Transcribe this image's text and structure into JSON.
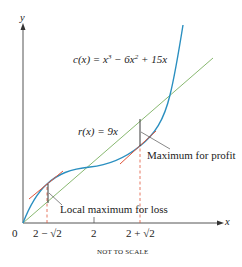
{
  "figure": {
    "axes": {
      "x_label": "x",
      "y_label": "y",
      "origin_label": "0",
      "x_ticks": [
        "2 − √2",
        "2",
        "2 + √2"
      ]
    },
    "curves": {
      "cost": {
        "name": "c(x)",
        "lhs": "c(x) = x",
        "exp1": "3",
        "mid": " − 6x",
        "exp2": "2",
        "rhs": " + 15x",
        "color": "#2a8fc0"
      },
      "revenue": {
        "name": "r(x)",
        "text": "r(x) = 9x",
        "color": "#7ab060"
      }
    },
    "tangent_color": "#e0553a",
    "dashed_color": "#e0553a",
    "annotations": {
      "profit": "Maximum for profit",
      "loss": "Local maximum for loss"
    },
    "caption": "NOT TO SCALE"
  }
}
